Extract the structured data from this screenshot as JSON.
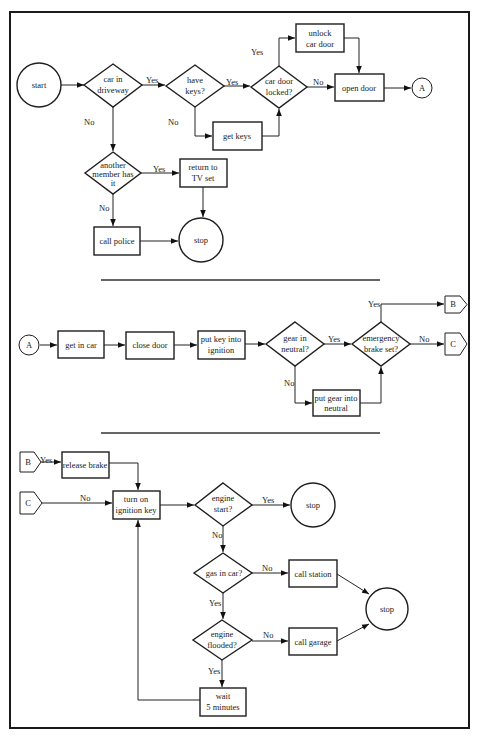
{
  "sections": [
    {
      "nodes": {
        "start": {
          "label": [
            "start"
          ]
        },
        "car_in_driveway": {
          "label": [
            "car in",
            "driveway"
          ]
        },
        "have_keys": {
          "label": [
            "have",
            "keys?"
          ]
        },
        "car_door_locked": {
          "label": [
            "car door",
            "locked?"
          ]
        },
        "unlock_car_door": {
          "label": [
            "unlock",
            "car door"
          ]
        },
        "open_door": {
          "label": [
            "open door"
          ]
        },
        "connector_a": {
          "label": [
            "A"
          ]
        },
        "get_keys": {
          "label": [
            "get keys"
          ]
        },
        "another_member": {
          "label": [
            "another",
            "member has",
            "it"
          ]
        },
        "return_to_tv": {
          "label": [
            "return to",
            "TV set"
          ]
        },
        "call_police": {
          "label": [
            "call police"
          ]
        },
        "stop": {
          "label": [
            "stop"
          ]
        }
      },
      "edge_labels": {
        "driveway_yes": "Yes",
        "driveway_no": "No",
        "keys_yes": "Yes",
        "keys_no": "No",
        "locked_yes": "Yes",
        "locked_no": "No",
        "member_yes": "Yes",
        "member_no": "No"
      }
    },
    {
      "nodes": {
        "connector_a": {
          "label": [
            "A"
          ]
        },
        "get_in_car": {
          "label": [
            "get in car"
          ]
        },
        "close_door": {
          "label": [
            "close door"
          ]
        },
        "put_key": {
          "label": [
            "put key into",
            "ignition"
          ]
        },
        "gear_neutral": {
          "label": [
            "gear in",
            "neutral?"
          ]
        },
        "emergency_brake": {
          "label": [
            "emergency",
            "brake set?"
          ]
        },
        "put_gear_neutral": {
          "label": [
            "put gear into",
            "neutral"
          ]
        },
        "connector_b": {
          "label": [
            "B"
          ]
        },
        "connector_c": {
          "label": [
            "C"
          ]
        }
      },
      "edge_labels": {
        "gear_yes": "Yes",
        "gear_no": "No",
        "brake_yes": "Yes",
        "brake_no": "No"
      }
    },
    {
      "nodes": {
        "connector_b": {
          "label": [
            "B"
          ]
        },
        "connector_c": {
          "label": [
            "C"
          ]
        },
        "release_brake": {
          "label": [
            "release brake"
          ]
        },
        "turn_on_ignition": {
          "label": [
            "turn on",
            "ignition key"
          ]
        },
        "engine_start": {
          "label": [
            "engine",
            "start?"
          ]
        },
        "stop_success": {
          "label": [
            "stop"
          ]
        },
        "gas_in_car": {
          "label": [
            "gas in car?"
          ]
        },
        "call_station": {
          "label": [
            "call station"
          ]
        },
        "engine_flooded": {
          "label": [
            "engine",
            "flooded?"
          ]
        },
        "call_garage": {
          "label": [
            "call garage"
          ]
        },
        "stop_fail": {
          "label": [
            "stop"
          ]
        },
        "wait": {
          "label": [
            "wait",
            "5 minutes"
          ]
        }
      },
      "edge_labels": {
        "b_yes": "Yes",
        "c_no": "No",
        "start_yes": "Yes",
        "start_no": "No",
        "gas_no": "No",
        "gas_yes": "Yes",
        "flooded_no": "No",
        "flooded_yes": "Yes"
      }
    }
  ]
}
